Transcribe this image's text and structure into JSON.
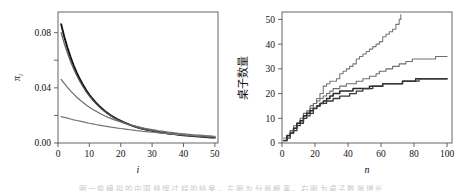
{
  "figure": {
    "panels": [
      "left",
      "right"
    ],
    "background_color": "#ffffff",
    "caption_partial": "图 一 些 模 拟 的 中 国 餐 馆 过 程 的 结 果 ， 左 图 为 分 量 概 率 ， 右 图 为 桌 子 数 量 增 长"
  },
  "left_panel": {
    "ylabel": "π",
    "ylabel_sub": "i",
    "xlabel": "i",
    "ytick_labels": [
      "0.00",
      "0.04",
      "0.08"
    ],
    "xtick_labels": [
      "0",
      "10",
      "20",
      "30",
      "40",
      "50"
    ]
  },
  "right_panel": {
    "ylabel": "桌子数量",
    "xlabel": "n",
    "ytick_labels": [
      "0",
      "10",
      "20",
      "30",
      "40",
      "50"
    ],
    "xtick_labels": [
      "0",
      "20",
      "40",
      "60",
      "80",
      "100"
    ]
  },
  "chart_data": [
    {
      "type": "line",
      "title": "",
      "xlabel": "i",
      "ylabel": "π_i",
      "xlim": [
        0,
        51
      ],
      "ylim": [
        0.0,
        0.095
      ],
      "xticks": [
        0,
        10,
        20,
        30,
        40,
        50
      ],
      "yticks": [
        0.0,
        0.04,
        0.08
      ],
      "ytick_labels": [
        "0.00",
        "0.04",
        "0.08"
      ],
      "grid": false,
      "legend": null,
      "x": [
        1,
        2,
        3,
        4,
        5,
        6,
        7,
        8,
        9,
        10,
        11,
        12,
        13,
        14,
        15,
        16,
        17,
        18,
        19,
        20,
        21,
        22,
        23,
        24,
        25,
        26,
        27,
        28,
        29,
        30,
        31,
        32,
        33,
        34,
        35,
        36,
        37,
        38,
        39,
        40,
        41,
        42,
        43,
        44,
        45,
        46,
        47,
        48,
        49,
        50
      ],
      "series": [
        {
          "name": "run-1",
          "color": "#111111",
          "width": 1.9,
          "values": [
            0.0862,
            0.077,
            0.0692,
            0.0623,
            0.0562,
            0.0509,
            0.0462,
            0.042,
            0.0383,
            0.035,
            0.0321,
            0.0295,
            0.0271,
            0.025,
            0.0231,
            0.0214,
            0.0198,
            0.0184,
            0.0171,
            0.016,
            0.0149,
            0.014,
            0.0131,
            0.0123,
            0.0116,
            0.0109,
            0.0103,
            0.0098,
            0.0093,
            0.0088,
            0.0084,
            0.008,
            0.0076,
            0.0073,
            0.0069,
            0.0066,
            0.0064,
            0.0061,
            0.0058,
            0.0056,
            0.0054,
            0.0052,
            0.005,
            0.0048,
            0.0046,
            0.0045,
            0.0043,
            0.0042,
            0.004,
            0.0039
          ]
        },
        {
          "name": "run-2",
          "color": "#5a5a5a",
          "width": 1.2,
          "values": [
            0.08,
            0.0722,
            0.0653,
            0.0591,
            0.0537,
            0.0488,
            0.0445,
            0.0406,
            0.0371,
            0.034,
            0.0312,
            0.0287,
            0.0264,
            0.0244,
            0.0226,
            0.0209,
            0.0194,
            0.018,
            0.0168,
            0.0157,
            0.0147,
            0.0138,
            0.0129,
            0.0122,
            0.0115,
            0.0108,
            0.0103,
            0.0097,
            0.0092,
            0.0088,
            0.0084,
            0.008,
            0.0076,
            0.0073,
            0.007,
            0.0067,
            0.0064,
            0.0062,
            0.0059,
            0.0057,
            0.0055,
            0.0053,
            0.0051,
            0.0049,
            0.0048,
            0.0046,
            0.0045,
            0.0043,
            0.0042,
            0.0041
          ]
        },
        {
          "name": "run-3",
          "color": "#6b6b6b",
          "width": 1.2,
          "values": [
            0.0462,
            0.0432,
            0.0404,
            0.0378,
            0.0354,
            0.0332,
            0.0312,
            0.0293,
            0.0276,
            0.026,
            0.0245,
            0.0232,
            0.0219,
            0.0207,
            0.0196,
            0.0186,
            0.0177,
            0.0168,
            0.016,
            0.0152,
            0.0145,
            0.0138,
            0.0132,
            0.0126,
            0.012,
            0.0115,
            0.011,
            0.0105,
            0.0101,
            0.0097,
            0.0093,
            0.0089,
            0.0086,
            0.0083,
            0.008,
            0.0077,
            0.0074,
            0.0071,
            0.0069,
            0.0067,
            0.0064,
            0.0062,
            0.006,
            0.0058,
            0.0057,
            0.0055,
            0.0053,
            0.0052,
            0.005,
            0.0049
          ]
        },
        {
          "name": "run-4",
          "color": "#757575",
          "width": 1.2,
          "values": [
            0.0191,
            0.0186,
            0.018,
            0.0174,
            0.0168,
            0.0163,
            0.0158,
            0.0153,
            0.0148,
            0.0143,
            0.0139,
            0.0134,
            0.013,
            0.0126,
            0.0122,
            0.0119,
            0.0115,
            0.0112,
            0.0108,
            0.0105,
            0.0102,
            0.0099,
            0.0096,
            0.0093,
            0.009,
            0.0088,
            0.0085,
            0.0083,
            0.0081,
            0.0078,
            0.0076,
            0.0074,
            0.0072,
            0.007,
            0.0068,
            0.0067,
            0.0065,
            0.0063,
            0.0062,
            0.006,
            0.0059,
            0.0057,
            0.0056,
            0.0054,
            0.0053,
            0.0052,
            0.0051,
            0.0049,
            0.0048,
            0.0047
          ]
        }
      ]
    },
    {
      "type": "line",
      "title": "",
      "xlabel": "n",
      "ylabel": "桌子数量",
      "xlim": [
        0,
        103
      ],
      "ylim": [
        0,
        53
      ],
      "xticks": [
        0,
        20,
        40,
        60,
        80,
        100
      ],
      "yticks": [
        0,
        10,
        20,
        30,
        40,
        50
      ],
      "grid": false,
      "legend": null,
      "step": true,
      "series": [
        {
          "name": "tables-steep",
          "color": "#787878",
          "width": 1.1,
          "points": [
            [
              1,
              2
            ],
            [
              3,
              3
            ],
            [
              5,
              5
            ],
            [
              7,
              6
            ],
            [
              9,
              8
            ],
            [
              11,
              9
            ],
            [
              13,
              11
            ],
            [
              15,
              12
            ],
            [
              17,
              14
            ],
            [
              19,
              16
            ],
            [
              21,
              18
            ],
            [
              23,
              20
            ],
            [
              25,
              23
            ],
            [
              27,
              24
            ],
            [
              29,
              25
            ],
            [
              31,
              25
            ],
            [
              33,
              26
            ],
            [
              35,
              28
            ],
            [
              37,
              29
            ],
            [
              39,
              30
            ],
            [
              41,
              31
            ],
            [
              43,
              32
            ],
            [
              45,
              34
            ],
            [
              47,
              35
            ],
            [
              49,
              36
            ],
            [
              51,
              37
            ],
            [
              53,
              38
            ],
            [
              55,
              39
            ],
            [
              57,
              40
            ],
            [
              59,
              41
            ],
            [
              61,
              43
            ],
            [
              63,
              44
            ],
            [
              65,
              45
            ],
            [
              67,
              46
            ],
            [
              69,
              48
            ],
            [
              71,
              50
            ],
            [
              72,
              52
            ]
          ]
        },
        {
          "name": "tables-mid",
          "color": "#6e6e6e",
          "width": 1.1,
          "points": [
            [
              1,
              1
            ],
            [
              3,
              3
            ],
            [
              5,
              5
            ],
            [
              7,
              7
            ],
            [
              9,
              8
            ],
            [
              11,
              10
            ],
            [
              13,
              12
            ],
            [
              15,
              13
            ],
            [
              17,
              15
            ],
            [
              19,
              16
            ],
            [
              21,
              17
            ],
            [
              23,
              18
            ],
            [
              25,
              19
            ],
            [
              27,
              20
            ],
            [
              29,
              21
            ],
            [
              31,
              22
            ],
            [
              33,
              22
            ],
            [
              35,
              23
            ],
            [
              37,
              23
            ],
            [
              39,
              24
            ],
            [
              41,
              24
            ],
            [
              43,
              24
            ],
            [
              45,
              25
            ],
            [
              47,
              25
            ],
            [
              49,
              26
            ],
            [
              51,
              26
            ],
            [
              53,
              27
            ],
            [
              55,
              27
            ],
            [
              57,
              28
            ],
            [
              59,
              29
            ],
            [
              61,
              29
            ],
            [
              63,
              30
            ],
            [
              65,
              30
            ],
            [
              67,
              31
            ],
            [
              69,
              31
            ],
            [
              71,
              32
            ],
            [
              73,
              32
            ],
            [
              75,
              33
            ],
            [
              77,
              33
            ],
            [
              79,
              34
            ],
            [
              81,
              34
            ],
            [
              83,
              34
            ],
            [
              85,
              34
            ],
            [
              87,
              34
            ],
            [
              89,
              34
            ],
            [
              91,
              34
            ],
            [
              93,
              35
            ],
            [
              95,
              35
            ],
            [
              97,
              35
            ],
            [
              100,
              35
            ]
          ]
        },
        {
          "name": "tables-dark-a",
          "color": "#2a2a2a",
          "width": 1.5,
          "points": [
            [
              1,
              1
            ],
            [
              3,
              3
            ],
            [
              5,
              4
            ],
            [
              7,
              6
            ],
            [
              9,
              8
            ],
            [
              11,
              9
            ],
            [
              13,
              11
            ],
            [
              15,
              12
            ],
            [
              17,
              13
            ],
            [
              19,
              14
            ],
            [
              21,
              15
            ],
            [
              23,
              16
            ],
            [
              25,
              17
            ],
            [
              27,
              18
            ],
            [
              29,
              19
            ],
            [
              31,
              20
            ],
            [
              33,
              20
            ],
            [
              35,
              21
            ],
            [
              37,
              21
            ],
            [
              39,
              21
            ],
            [
              41,
              21
            ],
            [
              43,
              22
            ],
            [
              45,
              22
            ],
            [
              47,
              22
            ],
            [
              49,
              22
            ],
            [
              51,
              22
            ],
            [
              53,
              23
            ],
            [
              55,
              23
            ],
            [
              57,
              23
            ],
            [
              59,
              23
            ],
            [
              61,
              24
            ],
            [
              63,
              24
            ],
            [
              65,
              24
            ],
            [
              67,
              24
            ],
            [
              69,
              24
            ],
            [
              71,
              24
            ],
            [
              73,
              25
            ],
            [
              75,
              25
            ],
            [
              77,
              25
            ],
            [
              79,
              25
            ],
            [
              81,
              26
            ],
            [
              83,
              26
            ],
            [
              85,
              26
            ],
            [
              87,
              26
            ],
            [
              89,
              26
            ],
            [
              91,
              26
            ],
            [
              93,
              26
            ],
            [
              95,
              26
            ],
            [
              97,
              26
            ],
            [
              100,
              26
            ]
          ]
        },
        {
          "name": "tables-dark-b",
          "color": "#3a3a3a",
          "width": 1.3,
          "points": [
            [
              1,
              1
            ],
            [
              3,
              2
            ],
            [
              5,
              4
            ],
            [
              7,
              5
            ],
            [
              9,
              7
            ],
            [
              11,
              8
            ],
            [
              13,
              10
            ],
            [
              15,
              11
            ],
            [
              17,
              12
            ],
            [
              19,
              14
            ],
            [
              21,
              15
            ],
            [
              23,
              16
            ],
            [
              25,
              16
            ],
            [
              27,
              17
            ],
            [
              29,
              17
            ],
            [
              31,
              18
            ],
            [
              33,
              18
            ],
            [
              35,
              19
            ],
            [
              37,
              19
            ],
            [
              39,
              19
            ],
            [
              41,
              20
            ],
            [
              43,
              20
            ],
            [
              45,
              21
            ],
            [
              47,
              21
            ],
            [
              49,
              22
            ],
            [
              51,
              22
            ],
            [
              53,
              22
            ],
            [
              55,
              23
            ],
            [
              57,
              23
            ],
            [
              59,
              23
            ],
            [
              61,
              24
            ],
            [
              63,
              24
            ],
            [
              65,
              24
            ],
            [
              67,
              24
            ],
            [
              69,
              24
            ],
            [
              71,
              24
            ],
            [
              73,
              25
            ],
            [
              75,
              25
            ],
            [
              77,
              25
            ],
            [
              79,
              25
            ],
            [
              81,
              25
            ],
            [
              83,
              26
            ],
            [
              85,
              26
            ],
            [
              87,
              26
            ],
            [
              89,
              26
            ],
            [
              91,
              26
            ],
            [
              93,
              26
            ],
            [
              95,
              26
            ],
            [
              97,
              26
            ],
            [
              100,
              26
            ]
          ]
        }
      ]
    }
  ]
}
